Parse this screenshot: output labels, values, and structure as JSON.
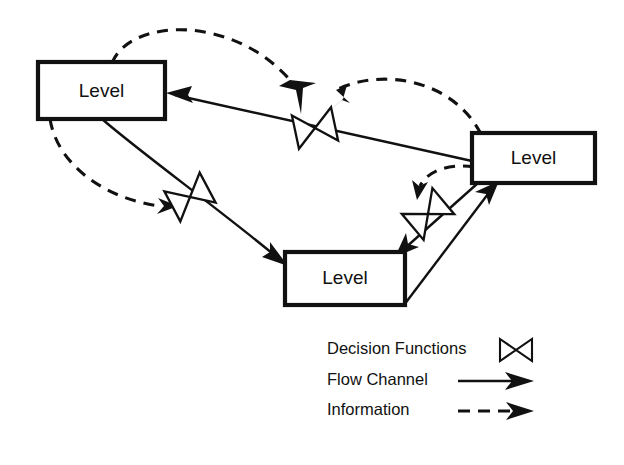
{
  "diagram": {
    "background_color": "#ffffff",
    "ink_color": "#111111",
    "nodes": [
      {
        "id": "level-left",
        "label": "Level",
        "x": 38,
        "y": 62,
        "width": 127,
        "height": 57
      },
      {
        "id": "level-right",
        "label": "Level",
        "x": 472,
        "y": 133,
        "width": 123,
        "height": 50
      },
      {
        "id": "level-bottom",
        "label": "Level",
        "x": 285,
        "y": 252,
        "width": 120,
        "height": 53
      }
    ],
    "valves": [
      {
        "id": "valve-top",
        "name": "decision-function-top",
        "x": 315,
        "y": 128,
        "rotation": -12
      },
      {
        "id": "valve-middle",
        "name": "decision-function-middle",
        "x": 190,
        "y": 197,
        "rotation": -28
      },
      {
        "id": "valve-right",
        "name": "decision-function-right",
        "x": 428,
        "y": 214,
        "rotation": -40
      }
    ],
    "edges": [
      {
        "id": "flow-right-to-left",
        "kind": "flow",
        "from": "level-right",
        "to": "level-left",
        "through": "valve-top"
      },
      {
        "id": "flow-left-to-bottom",
        "kind": "flow",
        "from": "level-left",
        "to": "level-bottom",
        "through": "valve-middle"
      },
      {
        "id": "flow-right-to-bottom",
        "kind": "flow",
        "from": "level-right",
        "to": "level-bottom",
        "through": "valve-right"
      },
      {
        "id": "flow-bottom-to-right",
        "kind": "flow",
        "from": "level-bottom",
        "to": "level-right",
        "through": null
      },
      {
        "id": "info-left-to-valvetop",
        "kind": "information",
        "from": "level-left",
        "to": "valve-top"
      },
      {
        "id": "info-right-to-valvetop",
        "kind": "information",
        "from": "level-right",
        "to": "valve-top"
      },
      {
        "id": "info-left-to-valvemiddle",
        "kind": "information",
        "from": "level-left",
        "to": "valve-middle"
      },
      {
        "id": "info-right-to-valveright",
        "kind": "information",
        "from": "level-right",
        "to": "valve-right"
      }
    ]
  },
  "legend": {
    "items": [
      {
        "id": "legend-decision-functions",
        "label": "Decision Functions",
        "symbol": "valve-icon"
      },
      {
        "id": "legend-flow-channel",
        "label": "Flow Channel",
        "symbol": "solid-arrow-icon"
      },
      {
        "id": "legend-information",
        "label": "Information",
        "symbol": "dashed-arrow-icon"
      }
    ]
  }
}
